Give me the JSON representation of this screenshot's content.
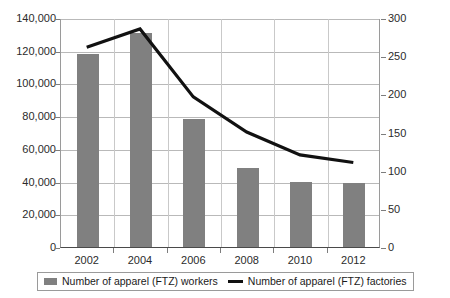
{
  "chart_data": {
    "type": "bar",
    "title": "",
    "subtitle": "",
    "xlabel": "",
    "ylabel": "",
    "categories": [
      "2002",
      "2004",
      "2006",
      "2008",
      "2010",
      "2012"
    ],
    "grid": true,
    "legend_position": "bottom",
    "series": [
      {
        "name": "Number of apparel (FTZ) workers",
        "type": "bar",
        "axis": "left",
        "color": "#808080",
        "values": [
          118000,
          131000,
          78000,
          48000,
          40000,
          39000
        ]
      },
      {
        "name": "Number of apparel (FTZ) factories",
        "type": "line",
        "axis": "right",
        "color": "#111111",
        "values": [
          263,
          287,
          198,
          152,
          122,
          112
        ]
      }
    ],
    "left_axis": {
      "label": "",
      "ylim": [
        0,
        140000
      ],
      "tick_values": [
        0,
        20000,
        40000,
        60000,
        80000,
        100000,
        120000,
        140000
      ],
      "ticks": [
        "0",
        "20,000",
        "40,000",
        "60,000",
        "80,000",
        "100,000",
        "120,000",
        "140,000"
      ]
    },
    "right_axis": {
      "label": "",
      "ylim": [
        0,
        300
      ],
      "tick_values": [
        0,
        50,
        100,
        150,
        200,
        250,
        300
      ],
      "ticks": [
        "0",
        "50",
        "100",
        "150",
        "200",
        "250",
        "300"
      ]
    }
  },
  "legend": {
    "items": [
      {
        "label": "Number of apparel (FTZ) workers",
        "marker": "bar-swatch-icon",
        "color": "#808080"
      },
      {
        "label": "Number of apparel (FTZ) factories",
        "marker": "line-swatch-icon",
        "color": "#111111"
      }
    ]
  }
}
